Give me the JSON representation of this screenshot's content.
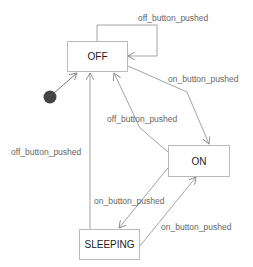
{
  "diagram": {
    "type": "state-machine",
    "title_cutoff": "~ ~ ~~~~~~~ ~~~~~~~ ~~~ ~",
    "states": [
      {
        "id": "off",
        "label": "OFF"
      },
      {
        "id": "on",
        "label": "ON"
      },
      {
        "id": "sleeping",
        "label": "SLEEPING"
      }
    ],
    "initial_state": "off",
    "transitions": [
      {
        "from": "OFF",
        "to": "OFF",
        "label": "off_button_pushed"
      },
      {
        "from": "OFF",
        "to": "ON",
        "label": "on_button_pushed"
      },
      {
        "from": "ON",
        "to": "OFF",
        "label": "off_button_pushed"
      },
      {
        "from": "SLEEPING",
        "to": "OFF",
        "label": "off_button_pushed"
      },
      {
        "from": "ON",
        "to": "SLEEPING",
        "label": "on_button_pushed"
      },
      {
        "from": "SLEEPING",
        "to": "ON",
        "label": "on_button_pushed"
      }
    ],
    "colors": {
      "line": "#999999",
      "box_border": "#bbbbbb",
      "initial_dot": "#444444"
    }
  }
}
